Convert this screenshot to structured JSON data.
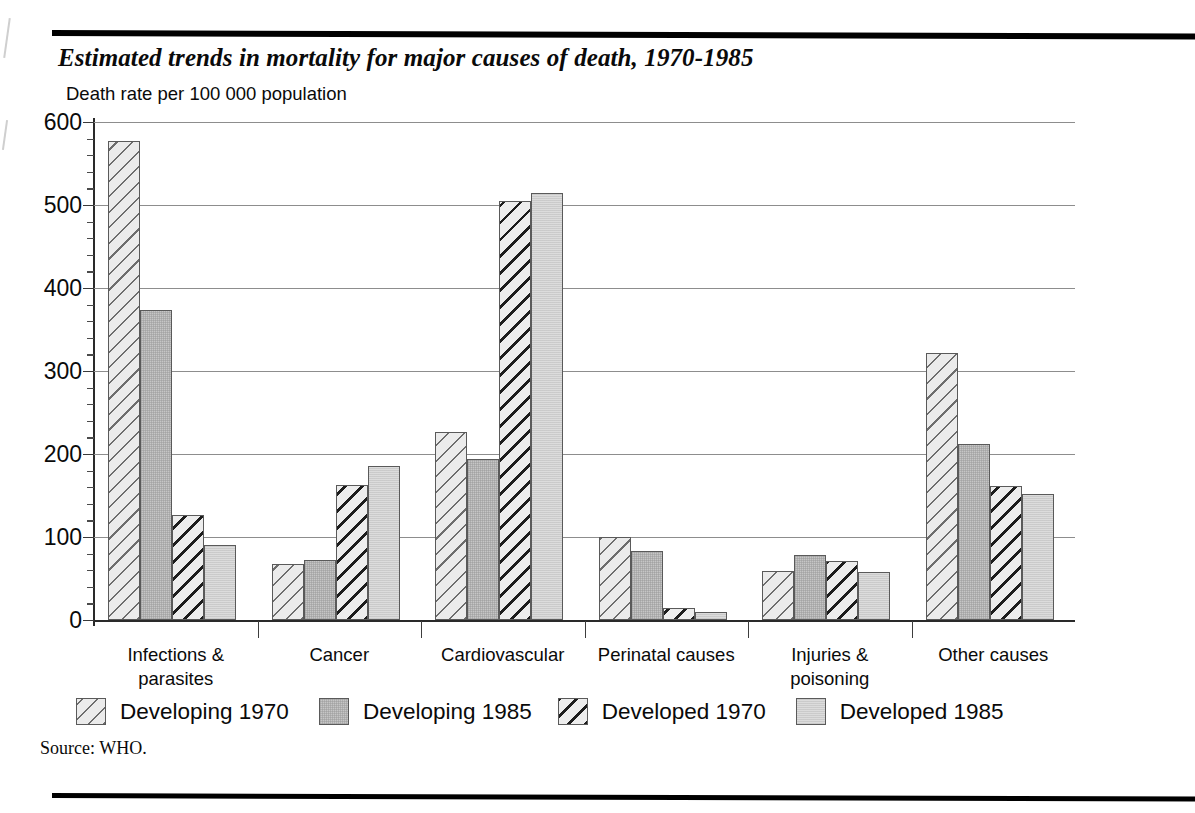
{
  "figure": {
    "title": "Estimated trends in mortality for major causes of death, 1970-1985",
    "axis_title": "Death rate per 100 000 population",
    "source": "Source: WHO."
  },
  "chart_data": {
    "type": "bar",
    "title": "Estimated trends in mortality for major causes of death, 1970-1985",
    "subtitle": "",
    "xlabel": "",
    "ylabel": "Death rate per 100 000 population",
    "ylim": [
      0,
      600
    ],
    "ytick_step": 100,
    "yminor_step": 20,
    "grid": true,
    "legend_position": "bottom",
    "categories": [
      "Infections &\nparasites",
      "Cancer",
      "Cardiovascular",
      "Perinatal causes",
      "Injuries &\npoisoning",
      "Other causes"
    ],
    "ytick_labels": [
      "0",
      "100",
      "200",
      "300",
      "400",
      "500",
      "600"
    ],
    "series": [
      {
        "name": "Developing 1970",
        "pattern": "diagonal-hatch-wide",
        "color": "#ebebeb",
        "values": [
          577,
          67,
          226,
          100,
          59,
          322
        ]
      },
      {
        "name": "Developing 1985",
        "pattern": "solid-grey",
        "color": "#c6c6c6",
        "values": [
          373,
          72,
          194,
          83,
          78,
          212
        ]
      },
      {
        "name": "Developed 1970",
        "pattern": "diagonal-hatch-dense",
        "color": "#ededed",
        "values": [
          127,
          163,
          505,
          15,
          71,
          161
        ]
      },
      {
        "name": "Developed 1985",
        "pattern": "solid-light",
        "color": "#dcdcdc",
        "values": [
          90,
          185,
          515,
          10,
          58,
          152
        ]
      }
    ]
  }
}
